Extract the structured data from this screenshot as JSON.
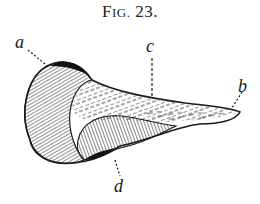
{
  "figure": {
    "caption_prefix": "F",
    "caption_smallcaps": "IG.",
    "caption_number": "23."
  },
  "labels": {
    "a": "a",
    "b": "b",
    "c": "c",
    "d": "d"
  },
  "colors": {
    "ink": "#1a1a1a",
    "background": "#ffffff"
  }
}
